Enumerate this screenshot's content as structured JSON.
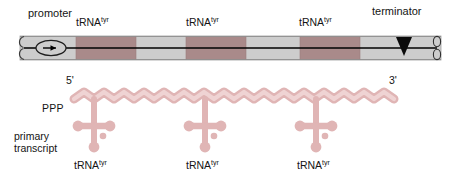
{
  "figure": {
    "background_color": "#ffffff"
  },
  "colors": {
    "gene_block": "#a98a8a",
    "gene_block_edge": "#9d7d7d",
    "spacer_dna": "#cdcdcd",
    "spacer_dna_edge": "#9a9a9a",
    "rna_fill": "#e3b8b8",
    "rna_edge": "#c18e8e",
    "line": "#000000",
    "text": "#141414"
  },
  "dna": {
    "label_promoter": "promoter",
    "label_terminator": "terminator",
    "promoter_icon": "promoter-oval-arrow-icon",
    "terminator_icon": "terminator-triangle-icon",
    "left_end_icon": "dna-broken-end-icon",
    "right_end_icon": "dna-broken-end-icon",
    "genes": [
      {
        "label": "tRNA",
        "superscript": "tyr"
      },
      {
        "label": "tRNA",
        "superscript": "tyr"
      },
      {
        "label": "tRNA",
        "superscript": "tyr"
      }
    ]
  },
  "transcript": {
    "label_five_prime": "5'",
    "label_three_prime": "3'",
    "label_ppp": "PPP",
    "label_primary_line1": "primary",
    "label_primary_line2": "transcript",
    "strand_icon": "wavy-rna-strand-icon",
    "trnas": [
      {
        "label": "tRNA",
        "superscript": "tyr",
        "icon": "trna-cloverleaf-icon"
      },
      {
        "label": "tRNA",
        "superscript": "tyr",
        "icon": "trna-cloverleaf-icon"
      },
      {
        "label": "tRNA",
        "superscript": "tyr",
        "icon": "trna-cloverleaf-icon"
      }
    ]
  }
}
